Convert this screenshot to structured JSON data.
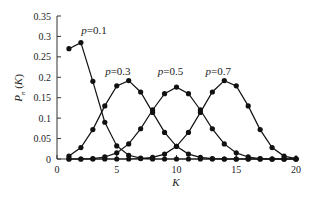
{
  "chart_data": {
    "type": "line",
    "title": "",
    "xlabel": "K",
    "ylabel": "P_n (K)",
    "xlim": [
      0,
      20
    ],
    "ylim": [
      0,
      0.35
    ],
    "xticks": [
      0,
      5,
      10,
      15,
      20
    ],
    "yticks": [
      0,
      0.05,
      0.1,
      0.15,
      0.2,
      0.25,
      0.3,
      0.35
    ],
    "ytick_labels": [
      "0",
      "0.05",
      "0.1",
      "0.15",
      "0.2",
      "0.25",
      "0.3",
      "0.35"
    ],
    "xtick_labels": [
      "0",
      "5",
      "10",
      "15",
      "20"
    ],
    "grid": false,
    "legend": "inline labels",
    "x": [
      1,
      2,
      3,
      4,
      5,
      6,
      7,
      8,
      9,
      10,
      11,
      12,
      13,
      14,
      15,
      16,
      17,
      18,
      19,
      20
    ],
    "series": [
      {
        "name": "p=0.1",
        "label_pos": [
          3.2,
          0.305
        ],
        "values": [
          0.27,
          0.285,
          0.19,
          0.09,
          0.032,
          0.009,
          0.002,
          0.0,
          0.0,
          0.0,
          0.0,
          0.0,
          0.0,
          0.0,
          0.0,
          0.0,
          0.0,
          0.0,
          0.0,
          0.0
        ]
      },
      {
        "name": "p=0.3",
        "label_pos": [
          5.2,
          0.205
        ],
        "values": [
          0.007,
          0.028,
          0.072,
          0.13,
          0.179,
          0.192,
          0.164,
          0.114,
          0.065,
          0.031,
          0.012,
          0.004,
          0.001,
          0.0,
          0.0,
          0.0,
          0.0,
          0.0,
          0.0,
          0.0
        ]
      },
      {
        "name": "p=0.5",
        "label_pos": [
          9.6,
          0.205
        ],
        "values": [
          0.0,
          0.0,
          0.001,
          0.005,
          0.015,
          0.037,
          0.074,
          0.12,
          0.16,
          0.176,
          0.16,
          0.12,
          0.074,
          0.037,
          0.015,
          0.005,
          0.001,
          0.0,
          0.0,
          0.0
        ]
      },
      {
        "name": "p=0.7",
        "label_pos": [
          13.6,
          0.205
        ],
        "values": [
          0.0,
          0.0,
          0.0,
          0.0,
          0.0,
          0.0,
          0.001,
          0.004,
          0.012,
          0.031,
          0.065,
          0.114,
          0.164,
          0.192,
          0.179,
          0.13,
          0.072,
          0.028,
          0.007,
          0.001
        ]
      }
    ]
  }
}
